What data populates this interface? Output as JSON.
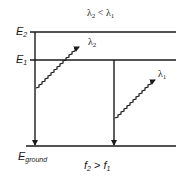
{
  "diagram": {
    "type": "energy-level-diagram",
    "top_relation": {
      "text": "λ₂ < λ₁",
      "left": "λ",
      "left_sub": "2",
      "op": " < ",
      "right": "λ",
      "right_sub": "1"
    },
    "bottom_relation": {
      "text": "f₂ > f₁",
      "left": "f",
      "left_sub": "2",
      "op": " > ",
      "right": "f",
      "right_sub": "1"
    },
    "levels": [
      {
        "name": "E2",
        "label": "E",
        "sub": "2",
        "y": 32
      },
      {
        "name": "E1",
        "label": "E",
        "sub": "1",
        "y": 60
      },
      {
        "name": "Eground",
        "label": "E",
        "sub": "ground",
        "y": 146
      }
    ],
    "transitions": [
      {
        "from": "E2",
        "to": "Eground",
        "photon_label": "λ",
        "photon_sub": "2"
      },
      {
        "from": "E1",
        "to": "Eground",
        "photon_label": "λ",
        "photon_sub": "1"
      }
    ],
    "colors": {
      "line": "#1a1a1a",
      "background": "#ffffff"
    }
  }
}
